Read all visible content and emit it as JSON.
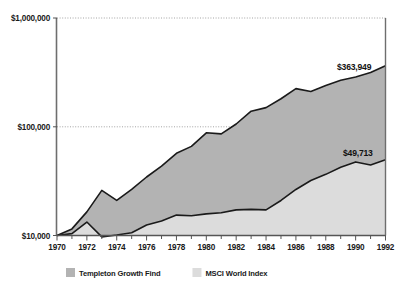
{
  "chart_data": {
    "type": "area",
    "title": "",
    "subtitle": "",
    "xlabel": "",
    "ylabel": "",
    "scale": "log",
    "ylim": [
      10000,
      1000000
    ],
    "ytick_labels": [
      "$1,000,000",
      "$100,000",
      "$10,000"
    ],
    "ytick_values": [
      1000000,
      100000,
      10000
    ],
    "grid": true,
    "legend_position": "bottom",
    "x": [
      1970,
      1971,
      1972,
      1973,
      1974,
      1975,
      1976,
      1977,
      1978,
      1979,
      1980,
      1981,
      1982,
      1983,
      1984,
      1985,
      1986,
      1987,
      1988,
      1989,
      1990,
      1991,
      1992
    ],
    "xtick_labels": [
      "1970",
      "1972",
      "1974",
      "1976",
      "1978",
      "1980",
      "1982",
      "1984",
      "1986",
      "1988",
      "1990",
      "1992"
    ],
    "series": [
      {
        "name": "Templeton Growth Find",
        "color": "#b3b3b3",
        "end_label": "$363,949",
        "end_value": 363949,
        "values": [
          10000,
          11500,
          16500,
          26000,
          21000,
          26500,
          34500,
          43500,
          57000,
          66000,
          88000,
          86000,
          106000,
          139000,
          150000,
          181000,
          224000,
          211000,
          239000,
          268000,
          287000,
          315000,
          363949
        ]
      },
      {
        "name": "MSCI World Index",
        "color": "#dcdcdc",
        "end_label": "$49,713",
        "end_value": 49713,
        "values": [
          10000,
          10400,
          13300,
          9700,
          10100,
          10600,
          12500,
          13600,
          15400,
          15200,
          15800,
          16200,
          17200,
          17400,
          17200,
          21000,
          26500,
          32000,
          36500,
          42500,
          47500,
          44500,
          49713
        ]
      }
    ]
  },
  "legend": {
    "items": [
      {
        "label": "Templeton Growth Find",
        "color": "#b3b3b3"
      },
      {
        "label": "MSCI World Index",
        "color": "#dcdcdc"
      }
    ]
  }
}
